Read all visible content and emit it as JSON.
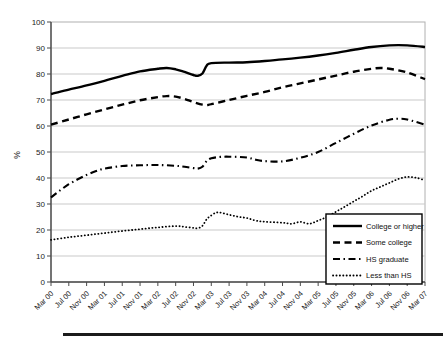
{
  "chart_data": {
    "type": "line",
    "title": "",
    "xlabel": "",
    "ylabel": "%",
    "ylim": [
      0,
      100
    ],
    "ytick_step": 10,
    "grid": "horizontal",
    "x_axis_unit": "months since Mar 2000",
    "x_months_range": [
      0,
      84
    ],
    "x_months_per_tick": 4,
    "x_tick_labels": [
      "Mar 00",
      "Jul 00",
      "Nov 00",
      "Mar 01",
      "Jul 01",
      "Nov 01",
      "Mar 02",
      "Jul 02",
      "Nov 02",
      "Mar 03",
      "Jul 03",
      "Nov 03",
      "Mar 04",
      "Jul 04",
      "Nov 04",
      "Mar 05",
      "Jul 05",
      "Nov 05",
      "Mar 06",
      "Jul 06",
      "Nov 06",
      "Mar 07"
    ],
    "legend": {
      "position": "inside-lower-right",
      "border": true,
      "background": "#ffffff"
    },
    "colors": {
      "line": "#000000",
      "grid": "#c9c9c9",
      "axis": "#4a4a4a",
      "frame": "#b0b0b0",
      "tick_text": "#1a1a1a"
    },
    "series": [
      {
        "name": "College or higher",
        "line_style": "solid",
        "color": "#000000",
        "points_month_value": [
          [
            0,
            72.3
          ],
          [
            4,
            74
          ],
          [
            8,
            75.6
          ],
          [
            12,
            77.4
          ],
          [
            16,
            79.3
          ],
          [
            20,
            81
          ],
          [
            24,
            82
          ],
          [
            26,
            82.3
          ],
          [
            28,
            81.8
          ],
          [
            30,
            80.8
          ],
          [
            32,
            79.6
          ],
          [
            33,
            79.3
          ],
          [
            34,
            80.2
          ],
          [
            35,
            83.3
          ],
          [
            36,
            84.2
          ],
          [
            40,
            84.4
          ],
          [
            44,
            84.5
          ],
          [
            48,
            85
          ],
          [
            52,
            85.6
          ],
          [
            56,
            86.3
          ],
          [
            60,
            87.1
          ],
          [
            64,
            88.1
          ],
          [
            68,
            89.3
          ],
          [
            72,
            90.4
          ],
          [
            76,
            91
          ],
          [
            80,
            91
          ],
          [
            84,
            90.4
          ]
        ]
      },
      {
        "name": "Some college",
        "line_style": "dashed",
        "color": "#000000",
        "points_month_value": [
          [
            0,
            60.5
          ],
          [
            4,
            62.5
          ],
          [
            8,
            64.5
          ],
          [
            12,
            66.4
          ],
          [
            16,
            68.2
          ],
          [
            20,
            69.9
          ],
          [
            24,
            71.1
          ],
          [
            26,
            71.5
          ],
          [
            28,
            71.3
          ],
          [
            30,
            70.4
          ],
          [
            32,
            69.2
          ],
          [
            34,
            68.2
          ],
          [
            35,
            68
          ],
          [
            36,
            68.4
          ],
          [
            40,
            70
          ],
          [
            44,
            71.6
          ],
          [
            48,
            73.1
          ],
          [
            52,
            74.9
          ],
          [
            56,
            76.4
          ],
          [
            60,
            77.9
          ],
          [
            64,
            79.4
          ],
          [
            68,
            80.9
          ],
          [
            72,
            82
          ],
          [
            74,
            82.3
          ],
          [
            76,
            82
          ],
          [
            80,
            80.6
          ],
          [
            84,
            78
          ]
        ]
      },
      {
        "name": "HS graduate",
        "line_style": "dashdot",
        "color": "#000000",
        "points_month_value": [
          [
            0,
            32.5
          ],
          [
            2,
            35.2
          ],
          [
            4,
            37.6
          ],
          [
            6,
            39.5
          ],
          [
            8,
            41.2
          ],
          [
            10,
            42.6
          ],
          [
            12,
            43.6
          ],
          [
            16,
            44.6
          ],
          [
            20,
            44.9
          ],
          [
            24,
            45
          ],
          [
            28,
            44.7
          ],
          [
            30,
            44.3
          ],
          [
            32,
            43.8
          ],
          [
            33,
            43.6
          ],
          [
            34,
            44.3
          ],
          [
            35,
            46.6
          ],
          [
            36,
            47.6
          ],
          [
            38,
            48.1
          ],
          [
            40,
            48.2
          ],
          [
            44,
            47.9
          ],
          [
            46,
            47
          ],
          [
            48,
            46.5
          ],
          [
            52,
            46.4
          ],
          [
            56,
            47.8
          ],
          [
            60,
            50
          ],
          [
            64,
            53.5
          ],
          [
            68,
            57
          ],
          [
            72,
            60.2
          ],
          [
            76,
            62.4
          ],
          [
            78,
            62.8
          ],
          [
            80,
            62.5
          ],
          [
            84,
            60.5
          ]
        ]
      },
      {
        "name": "Less than HS",
        "line_style": "dotted",
        "color": "#000000",
        "points_month_value": [
          [
            0,
            16.2
          ],
          [
            4,
            17.2
          ],
          [
            8,
            18
          ],
          [
            12,
            18.8
          ],
          [
            16,
            19.6
          ],
          [
            20,
            20.3
          ],
          [
            24,
            21
          ],
          [
            28,
            21.5
          ],
          [
            30,
            21.2
          ],
          [
            32,
            20.8
          ],
          [
            33,
            20.7
          ],
          [
            34,
            21.6
          ],
          [
            35,
            24.2
          ],
          [
            36,
            25.6
          ],
          [
            37,
            26.6
          ],
          [
            38,
            26.7
          ],
          [
            40,
            25.9
          ],
          [
            42,
            25.1
          ],
          [
            44,
            24.6
          ],
          [
            46,
            23.6
          ],
          [
            48,
            23.2
          ],
          [
            52,
            22.8
          ],
          [
            54,
            22.4
          ],
          [
            56,
            23.1
          ],
          [
            58,
            22.4
          ],
          [
            60,
            23.6
          ],
          [
            62,
            25.1
          ],
          [
            64,
            27
          ],
          [
            66,
            29
          ],
          [
            68,
            31
          ],
          [
            70,
            33
          ],
          [
            72,
            35.1
          ],
          [
            74,
            36.6
          ],
          [
            76,
            38.1
          ],
          [
            78,
            39.6
          ],
          [
            80,
            40.4
          ],
          [
            82,
            40.1
          ],
          [
            84,
            39.1
          ]
        ]
      }
    ],
    "divider_rule": {
      "present": true,
      "color": "#1b1b1b"
    }
  }
}
